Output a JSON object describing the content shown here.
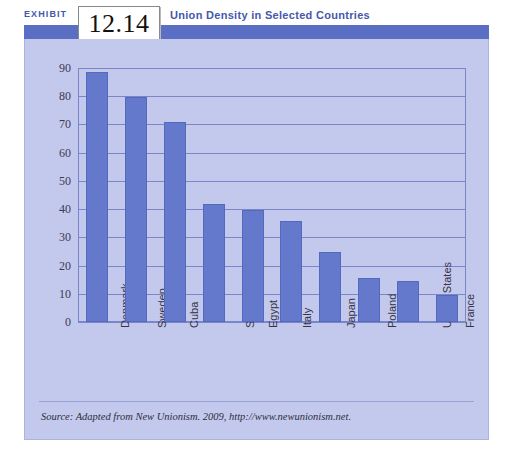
{
  "exhibit": {
    "label": "EXHIBIT",
    "number": "12.14",
    "title": "Union Density in Selected Countries"
  },
  "source": {
    "text": "Source: Adapted from New Unionism. 2009, http://www.newunionism.net."
  },
  "colors": {
    "bar": "#6478cc",
    "panel": "#c3c9ec",
    "header_band": "#5a6fc4",
    "title_text": "#4558ac",
    "gridline": "#7b86c9"
  },
  "chart_data": {
    "type": "bar",
    "title": "Union Density in Selected Countries",
    "xlabel": "",
    "ylabel": "",
    "ylim": [
      0,
      90
    ],
    "yticks": [
      0,
      10,
      20,
      30,
      40,
      50,
      60,
      70,
      80,
      90
    ],
    "grid": true,
    "legend": "none",
    "categories": [
      "Denmark",
      "Sweden",
      "Cuba",
      "South Africa",
      "Egypt",
      "Italy",
      "Japan",
      "Poland",
      "United States",
      "France"
    ],
    "values": [
      88,
      79,
      70,
      41,
      39,
      35,
      24,
      15,
      14,
      9
    ]
  }
}
